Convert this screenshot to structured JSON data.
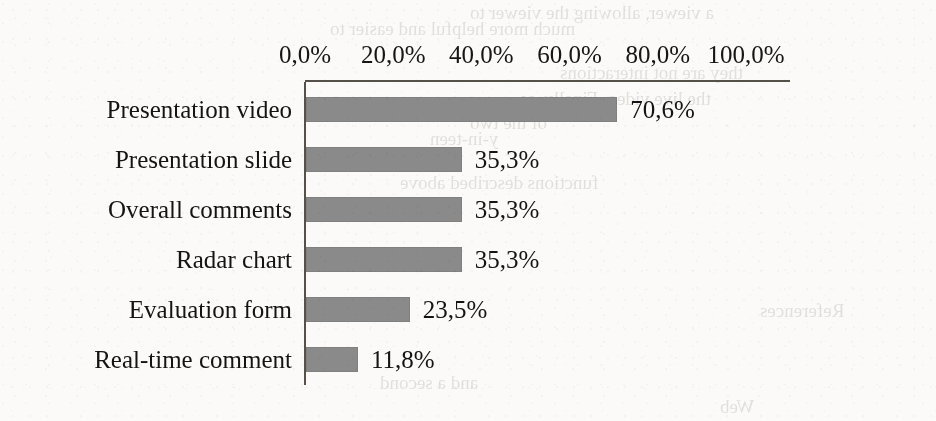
{
  "chart_data": {
    "type": "bar",
    "orientation": "horizontal",
    "title": "",
    "subtitle": "",
    "xlabel": "",
    "ylabel": "",
    "categories": [
      "Presentation video",
      "Presentation slide",
      "Overall comments",
      "Radar chart",
      "Evaluation form",
      "Real-time comment"
    ],
    "values": [
      70.6,
      35.3,
      35.3,
      35.3,
      23.5,
      11.8
    ],
    "value_labels": [
      "70,6%",
      "35,3%",
      "35,3%",
      "35,3%",
      "23,5%",
      "11,8%"
    ],
    "xlim": [
      0,
      100
    ],
    "xticks": [
      0,
      20,
      40,
      60,
      80,
      100
    ],
    "xtick_labels": [
      "0,0%",
      "20,0%",
      "40,0%",
      "60,0%",
      "80,0%",
      "100,0%"
    ],
    "axis_position": "top",
    "grid": false,
    "legend": false,
    "decimal_separator": ",",
    "bar_color": "#8a8a8a",
    "axis_color": "#55504a",
    "text_color": "#141414",
    "background": "#fbfaf8"
  },
  "ghost_text": [
    {
      "text": "a viewer, allowing the viewer to",
      "x": 470,
      "y": 2
    },
    {
      "text": "much more helpful and easier to",
      "x": 330,
      "y": 18
    },
    {
      "text": "they are not interactions",
      "x": 560,
      "y": 62
    },
    {
      "text": "the live video. Finally, as",
      "x": 520,
      "y": 88
    },
    {
      "text": "of the two",
      "x": 470,
      "y": 112
    },
    {
      "text": "y-in-teen",
      "x": 430,
      "y": 128
    },
    {
      "text": "functions described above",
      "x": 400,
      "y": 172
    },
    {
      "text": "References",
      "x": 760,
      "y": 300
    },
    {
      "text": "and a second",
      "x": 380,
      "y": 372
    },
    {
      "text": "Web",
      "x": 720,
      "y": 396
    }
  ]
}
